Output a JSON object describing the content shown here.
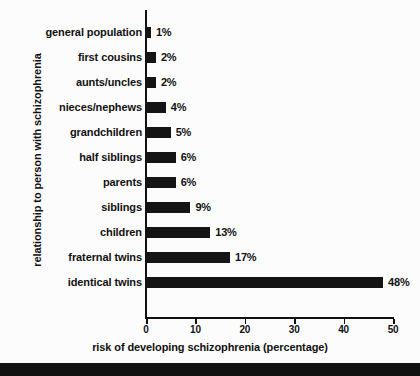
{
  "chart_data": {
    "type": "bar",
    "orientation": "horizontal",
    "title": "",
    "xlabel": "risk of developing schizophrenia (percentage)",
    "ylabel": "relationship to person with schizophrenia",
    "xlim": [
      0,
      50
    ],
    "xticks": [
      "0",
      "10",
      "20",
      "30",
      "40",
      "50"
    ],
    "grid": false,
    "legend": null,
    "bar_color": "#141414",
    "background_color": "#fcfcfc",
    "categories": [
      "general population",
      "first cousins",
      "aunts/uncles",
      "nieces/nephews",
      "grandchildren",
      "half siblings",
      "parents",
      "siblings",
      "children",
      "fraternal twins",
      "identical twins"
    ],
    "values": [
      1,
      2,
      2,
      4,
      5,
      6,
      6,
      9,
      13,
      17,
      48
    ],
    "data_labels": [
      "1%",
      "2%",
      "2%",
      "4%",
      "5%",
      "6%",
      "6%",
      "9%",
      "13%",
      "17%",
      "48%"
    ]
  }
}
